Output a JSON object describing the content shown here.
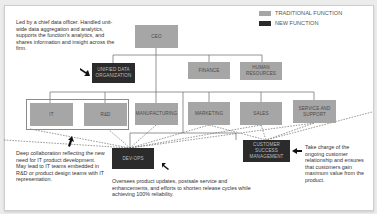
{
  "legend": {
    "traditional": {
      "label": "TRADITIONAL FUNCTION",
      "color": "#a6a6a6"
    },
    "new": {
      "label": "NEW FUNCTION",
      "color": "#2b2b2b"
    }
  },
  "nodes": {
    "ceo": {
      "label": "CEO",
      "type": "traditional"
    },
    "unified_data": {
      "label": "UNIFIED DATA ORGANIZATION",
      "type": "new"
    },
    "finance": {
      "label": "FINANCE",
      "type": "traditional"
    },
    "human_resources": {
      "label": "HUMAN RESOURCES",
      "type": "traditional"
    },
    "it": {
      "label": "IT",
      "type": "traditional"
    },
    "rd": {
      "label": "R&D",
      "type": "traditional"
    },
    "manufacturing": {
      "label": "MANUFACTURING",
      "type": "traditional"
    },
    "marketing": {
      "label": "MARKETING",
      "type": "traditional"
    },
    "sales": {
      "label": "SALES",
      "type": "traditional"
    },
    "service_support": {
      "label": "SERVICE AND SUPPORT",
      "type": "traditional"
    },
    "dev_ops": {
      "label": "DEV-OPS",
      "type": "new"
    },
    "customer_success": {
      "label": "CUSTOMER SUCCESS MANAGEMENT",
      "type": "new"
    }
  },
  "annotations": {
    "unified_data": "Led by a chief data officer. Handled unit-wide data aggregation and analytics, supports the function's analytics, and shares information and insight across the firm.",
    "it_rd": "Deep collaboration reflecting the new need for IT product development. May lead to IT teams embedded in R&D or product design teams with IT representation.",
    "dev_ops": "Oversees product updates, postsale service and enhancements, and efforts to shorten release cycles while achieving 100% reliability.",
    "customer_success": "Take charge of the ongoing customer relationship and ensures that customers gain maximum value from the product."
  },
  "colors": {
    "traditional": "#a6a6a6",
    "new": "#2b2b2b",
    "connector": "#7a7a7a"
  }
}
